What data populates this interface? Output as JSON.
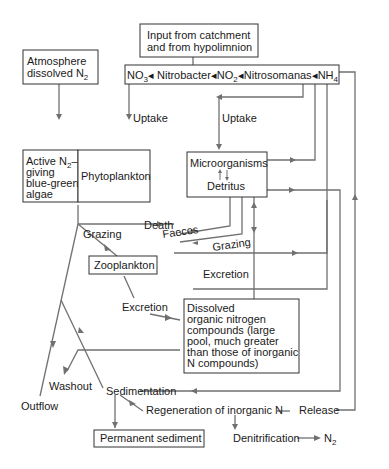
{
  "nodes": {
    "input": {
      "line1": "Input from catchment",
      "line2": "and from hypolimnion"
    },
    "atmosphere": {
      "line1": "Atmosphere",
      "line2": "dissolved N",
      "sub": "2"
    },
    "chain": {
      "no3": "NO",
      "no3_sub": "3",
      "nitrobacter": "Nitrobacter",
      "no2": "NO",
      "no2_sub": "2",
      "nitrosomanas": "Nitrosomanas",
      "nh4": "NH",
      "nh4_sub": "4"
    },
    "bluegreen": {
      "line1": "Active N",
      "line1_sub": "2",
      "line1_end": "–",
      "line2": "giving",
      "line3": "blue-green",
      "line4": "algae"
    },
    "phytoplankton": "Phytoplankton",
    "microorganisms": "Microorganisms",
    "detritus": "Detritus",
    "zooplankton": "Zooplankton",
    "don": {
      "line1": "Dissolved",
      "line2": "organic nitrogen",
      "line3": "compounds (large",
      "line4": "pool, much greater",
      "line5": "than those of inorganic",
      "line6": "N compounds)"
    },
    "permanent_sediment": "Permanent sediment"
  },
  "labels": {
    "uptake_left": "Uptake",
    "uptake_right": "Uptake",
    "death": "Death",
    "grazing_left": "Grazing",
    "faeces": "Faeces",
    "grazing_right": "Grazing",
    "excretion_right": "Excretion",
    "excretion_left": "Excretion",
    "washout": "Washout",
    "outflow": "Outflow",
    "sedimentation": "Sedimentation",
    "regeneration": "Regeneration of inorganic N",
    "release": "Release",
    "denitrification": "Denitrification",
    "n2": "N",
    "n2_sub": "2"
  },
  "colors": {
    "line": "#707070",
    "box_border": "#333333",
    "text": "#1a1a1a",
    "background": "#ffffff"
  }
}
